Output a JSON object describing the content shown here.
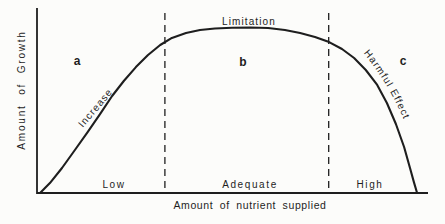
{
  "figure": {
    "background": "#fcfcfa",
    "ink": "#1e1e1e"
  },
  "chart_data": {
    "type": "line",
    "title": "",
    "xlabel": "Amount of nutrient supplied",
    "ylabel": "Amount of Growth",
    "xlim": [
      0,
      1
    ],
    "ylim": [
      0,
      1
    ],
    "grid": false,
    "axis_ticks": "none",
    "legend": "none",
    "series": [
      {
        "name": "growth-response-curve",
        "x": [
          0.008,
          0.018,
          0.033,
          0.064,
          0.097,
          0.13,
          0.161,
          0.192,
          0.222,
          0.253,
          0.284,
          0.315,
          0.345,
          0.381,
          0.417,
          0.455,
          0.499,
          0.545,
          0.591,
          0.634,
          0.673,
          0.711,
          0.747,
          0.78,
          0.811,
          0.841,
          0.87,
          0.895,
          0.918,
          0.939,
          0.954,
          0.964,
          0.972
        ],
        "y": [
          0.0,
          0.024,
          0.06,
          0.151,
          0.26,
          0.369,
          0.477,
          0.586,
          0.677,
          0.761,
          0.834,
          0.894,
          0.937,
          0.967,
          0.985,
          0.994,
          0.998,
          1.0,
          0.997,
          0.985,
          0.967,
          0.943,
          0.912,
          0.87,
          0.816,
          0.743,
          0.653,
          0.544,
          0.417,
          0.278,
          0.151,
          0.066,
          0.0
        ]
      }
    ],
    "zone_dividers_x": [
      0.327,
      0.746
    ],
    "zones": [
      {
        "letter": "a",
        "x_range_label": "Low",
        "curve_label": "Increase"
      },
      {
        "letter": "b",
        "x_range_label": "Adequate",
        "curve_label": "Limitation"
      },
      {
        "letter": "c",
        "x_range_label": "High",
        "curve_label": "Harmful Effect"
      }
    ]
  }
}
